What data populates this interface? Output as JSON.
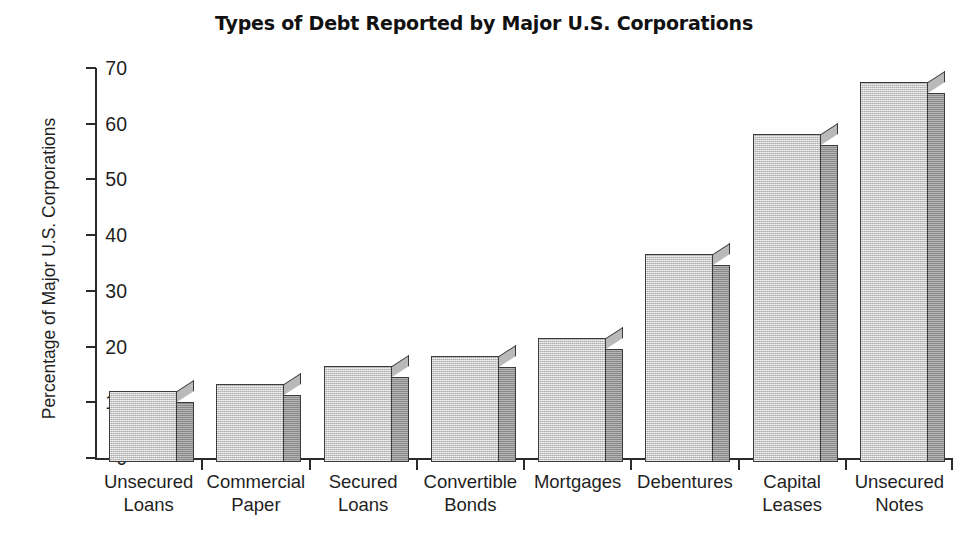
{
  "chart_data": {
    "type": "bar",
    "title": "Types of Debt Reported by Major U.S. Corporations",
    "xlabel": "",
    "ylabel": "Percentage of Major U.S. Corporations",
    "ylim": [
      0,
      70
    ],
    "yticks": [
      0,
      10,
      20,
      30,
      40,
      50,
      60,
      70
    ],
    "ytick_labels": [
      "0",
      "10",
      "20",
      "30",
      "40",
      "50",
      "60",
      "70"
    ],
    "grid": false,
    "legend": "none",
    "style": "3d-bar",
    "bar_face_color": "#cccccc",
    "bar_side_color": "#9d9d9d",
    "bar_edge_color": "#3a3a3a",
    "categories": [
      "Unsecured Loans",
      "Commercial Paper",
      "Secured Loans",
      "Convertible Bonds",
      "Mortgages",
      "Debentures",
      "Capital Leases",
      "Unsecured Notes"
    ],
    "category_lines": [
      [
        "Unsecured",
        "Loans"
      ],
      [
        "Commercial",
        "Paper"
      ],
      [
        "Secured",
        "Loans"
      ],
      [
        "Convertible",
        "Bonds"
      ],
      [
        "Mortgages",
        ""
      ],
      [
        "Debentures",
        ""
      ],
      [
        "Capital",
        "Leases"
      ],
      [
        "Unsecured",
        "Notes"
      ]
    ],
    "values": [
      12.8,
      14.0,
      17.2,
      19.0,
      22.3,
      37.4,
      58.8,
      68.2
    ]
  }
}
